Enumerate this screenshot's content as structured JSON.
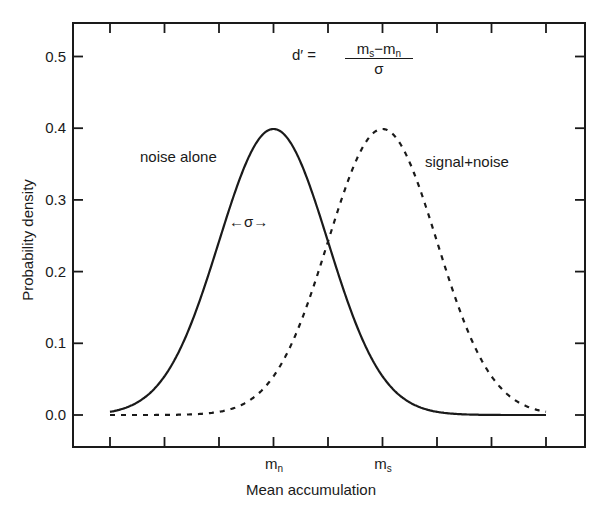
{
  "chart_data": {
    "type": "line",
    "title": "",
    "xlabel": "Mean accumulation",
    "ylabel": "Probability density",
    "ylim": [
      0.0,
      0.5
    ],
    "yticks": [
      "0.0",
      "0.1",
      "0.2",
      "0.3",
      "0.4",
      "0.5"
    ],
    "xticks_count": 9,
    "x_tick_labels": [
      {
        "tick_index": 3,
        "base": "m",
        "sub": "n"
      },
      {
        "tick_index": 5,
        "base": "m",
        "sub": "s"
      }
    ],
    "x_units": "standard deviations (tick spacing = 1σ)",
    "x": [
      -4,
      -3,
      -2,
      -1,
      0,
      1,
      2,
      3,
      4
    ],
    "series": [
      {
        "name": "noise alone",
        "style": "solid",
        "distribution": "normal",
        "mean_tick_index": 3,
        "sigma_ticks": 1,
        "peak": 0.4,
        "values_at_ticks": [
          0.004,
          0.054,
          0.242,
          0.399,
          0.242,
          0.054,
          0.004,
          0.0001,
          0.0
        ]
      },
      {
        "name": "signal+noise",
        "style": "dashed",
        "distribution": "normal",
        "mean_tick_index": 5,
        "sigma_ticks": 1,
        "peak": 0.4,
        "values_at_ticks": [
          0.0,
          0.0001,
          0.004,
          0.054,
          0.242,
          0.399,
          0.242,
          0.054,
          0.004
        ]
      }
    ],
    "annotations": [
      {
        "text": "noise alone",
        "near": "left of noise curve peak"
      },
      {
        "text": "signal+noise",
        "near": "right of signal curve peak"
      },
      {
        "text": "←σ→",
        "meaning": "one standard deviation width marker on noise curve"
      },
      {
        "text": "d′ = (m_s − m_n) / σ",
        "meaning": "sensitivity index formula"
      }
    ],
    "grid": false,
    "legend": "none (inline labels)"
  },
  "labels": {
    "ylabel": "Probability density",
    "xlabel": "Mean accumulation",
    "noise": "noise alone",
    "signal": "signal+noise",
    "sigma_marker": "←σ→",
    "y_ticks": [
      "0.0",
      "0.1",
      "0.2",
      "0.3",
      "0.4",
      "0.5"
    ],
    "mn_base": "m",
    "mn_sub": "n",
    "ms_base": "m",
    "ms_sub": "s",
    "formula_lhs": "d′ =",
    "formula_num": "m",
    "formula_num_sub1": "s",
    "formula_minus": "−m",
    "formula_num_sub2": "n",
    "formula_den": "σ"
  }
}
